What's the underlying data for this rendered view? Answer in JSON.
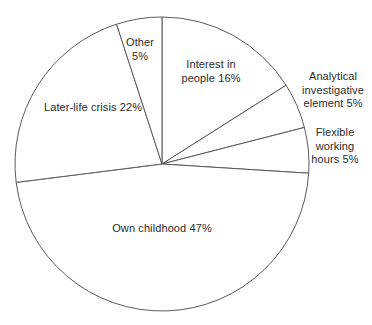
{
  "chart_data": {
    "type": "pie",
    "title": "",
    "subtitle": "",
    "xlabel": "",
    "ylabel": "",
    "legend_position": "none",
    "grid": false,
    "start_angle_deg": 0,
    "direction": "clockwise",
    "units": "percent",
    "categories": [
      "Interest in people",
      "Analytical investigative element",
      "Flexible working hours",
      "Own childhood",
      "Later-life crisis",
      "Other"
    ],
    "values": [
      16,
      5,
      5,
      47,
      22,
      5
    ],
    "slices": [
      {
        "name": "interest-in-people",
        "label": "Interest in\npeople 16%",
        "value": 16,
        "start_deg": 0,
        "end_deg": 57.6,
        "label_placement": "inside"
      },
      {
        "name": "analytical-investigative-element",
        "label": "Analytical\ninvestigative\nelement 5%",
        "value": 5,
        "start_deg": 57.6,
        "end_deg": 75.6,
        "label_placement": "outside-right"
      },
      {
        "name": "flexible-working-hours",
        "label": "Flexible\nworking\nhours 5%",
        "value": 5,
        "start_deg": 75.6,
        "end_deg": 93.6,
        "label_placement": "outside-right"
      },
      {
        "name": "own-childhood",
        "label": "Own childhood 47%",
        "value": 47,
        "start_deg": 93.6,
        "end_deg": 262.8,
        "label_placement": "inside"
      },
      {
        "name": "later-life-crisis",
        "label": "Later-life crisis 22%",
        "value": 22,
        "start_deg": 262.8,
        "end_deg": 342.0,
        "label_placement": "inside"
      },
      {
        "name": "other",
        "label": "Other\n5%",
        "value": 5,
        "start_deg": 342.0,
        "end_deg": 360.0,
        "label_placement": "inside"
      }
    ],
    "colors": {
      "background": "#ffffff",
      "slice_fill": "#ffffff",
      "slice_stroke": "#5a5a5a",
      "text": "#2b2b2b"
    },
    "geometry": {
      "center_x": 162,
      "center_y": 164,
      "radius": 147
    }
  },
  "labels": {
    "interest": "Interest in\npeople 16%",
    "analytical": "Analytical\ninvestigative\nelement 5%",
    "flexible": "Flexible\nworking\nhours 5%",
    "own_childhood": "Own childhood 47%",
    "later_life": "Later-life crisis 22%",
    "other": "Other\n5%"
  }
}
